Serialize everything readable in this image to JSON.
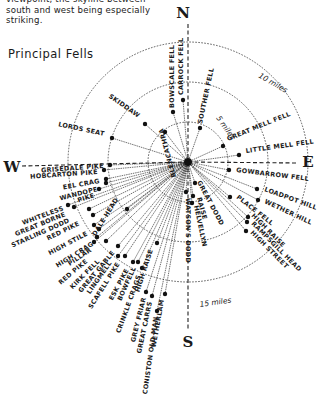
{
  "intro": {
    "lines": [
      "viewpoint, the skyline between",
      "south and west being especially",
      "striking."
    ]
  },
  "section_title": "Principal Fells",
  "diagram": {
    "center": [
      188,
      162
    ],
    "compass": {
      "N": "N",
      "E": "E",
      "S": "S",
      "W": "W"
    },
    "rings": [
      {
        "radius": 40,
        "label": "5 miles"
      },
      {
        "radius": 80,
        "label": "10 miles"
      },
      {
        "radius": 120,
        "label": "15 miles"
      }
    ],
    "fells": [
      {
        "name": "CARROCK FELL",
        "dot": [
          183,
          100
        ],
        "text": [
          183,
          95
        ],
        "rot": -90,
        "anchor": "start"
      },
      {
        "name": "BOWSCALE FELL",
        "dot": [
          173,
          112
        ],
        "text": [
          174,
          108
        ],
        "rot": -90,
        "anchor": "start",
        "flip": true
      },
      {
        "name": "SOUTHER FELL",
        "dot": [
          200,
          128
        ],
        "text": [
          202,
          124
        ],
        "rot": -78,
        "anchor": "start"
      },
      {
        "name": "BLENCATHRA",
        "dot": [
          165,
          132
        ],
        "text": [
          163,
          128
        ],
        "rot": -105,
        "anchor": "end",
        "flip": true
      },
      {
        "name": "SKIDDAW",
        "dot": [
          145,
          124
        ],
        "text": [
          138,
          118
        ],
        "rot": 35,
        "anchor": "end"
      },
      {
        "name": "LORDS SEAT",
        "dot": [
          112,
          138
        ],
        "text": [
          104,
          136
        ],
        "rot": 12,
        "anchor": "end"
      },
      {
        "name": "GREAT MELL FELL",
        "dot": [
          223,
          146
        ],
        "text": [
          228,
          141
        ],
        "rot": -22,
        "anchor": "start"
      },
      {
        "name": "LITTLE MELL FELL",
        "dot": [
          239,
          155
        ],
        "text": [
          246,
          153
        ],
        "rot": -8,
        "anchor": "start"
      },
      {
        "name": "GOWBARROW FELL",
        "dot": [
          229,
          170
        ],
        "text": [
          236,
          172
        ],
        "rot": 7,
        "anchor": "start"
      },
      {
        "name": "LOADPOT HILL",
        "dot": [
          257,
          189
        ],
        "text": [
          264,
          191
        ],
        "rot": 20,
        "anchor": "start"
      },
      {
        "name": "WETHER HILL",
        "dot": [
          258,
          200
        ],
        "text": [
          264,
          203
        ],
        "rot": 25,
        "anchor": "start"
      },
      {
        "name": "PLACE FELL",
        "dot": [
          230,
          197
        ],
        "text": [
          236,
          198
        ],
        "rot": 38,
        "anchor": "start"
      },
      {
        "name": "HIGH RAISE",
        "dot": [
          248,
          217
        ],
        "text": [
          251,
          216
        ],
        "rot": 45,
        "anchor": "start"
      },
      {
        "name": "RAMPSGILL HEAD",
        "dot": [
          247,
          222
        ],
        "text": [
          251,
          224
        ],
        "rot": 45,
        "anchor": "start"
      },
      {
        "name": "HIGH STREET",
        "dot": [
          246,
          231
        ],
        "text": [
          250,
          233
        ],
        "rot": 45,
        "anchor": "start"
      },
      {
        "name": "GREAT DODD",
        "dot": [
          195,
          183
        ],
        "text": [
          197,
          182
        ],
        "rot": 62,
        "anchor": "start"
      },
      {
        "name": "RAISE",
        "dot": [
          193,
          196
        ],
        "text": [
          197,
          198
        ],
        "rot": 75,
        "anchor": "start"
      },
      {
        "name": "HELVELLYN",
        "dot": [
          192,
          203
        ],
        "text": [
          194,
          206
        ],
        "rot": 78,
        "anchor": "start"
      },
      {
        "name": "WATSON'S DODD",
        "dot": [
          186,
          192
        ],
        "text": [
          186,
          198
        ],
        "rot": 90,
        "anchor": "start"
      },
      {
        "name": "GRISEDALE PIKE",
        "dot": [
          110,
          165
        ],
        "text": [
          104,
          168
        ],
        "rot": -4,
        "anchor": "end"
      },
      {
        "name": "HOBCARTON PIKE",
        "dot": [
          104,
          170
        ],
        "text": [
          98,
          174
        ],
        "rot": -4,
        "anchor": "end"
      },
      {
        "name": "EEL CRAG",
        "dot": [
          106,
          179
        ],
        "text": [
          100,
          183
        ],
        "rot": -10,
        "anchor": "end"
      },
      {
        "name": "WANDOPE",
        "dot": [
          106,
          183
        ],
        "text": [
          98,
          191
        ],
        "rot": -14,
        "anchor": "end"
      },
      {
        "name": "PIKE",
        "dot": [
          99,
          189
        ],
        "text": [
          95,
          197
        ],
        "rot": -18,
        "anchor": "end"
      },
      {
        "name": "WHITELESS",
        "dot": [
          68,
          205
        ],
        "text": [
          64,
          210
        ],
        "rot": -20,
        "anchor": "end"
      },
      {
        "name": "GREAT BORNE",
        "dot": [
          74,
          207
        ],
        "text": [
          66,
          216
        ],
        "rot": -22,
        "anchor": "end"
      },
      {
        "name": "STARLING DODD",
        "dot": [
          89,
          209
        ],
        "text": [
          70,
          222
        ],
        "rot": -24,
        "anchor": "end"
      },
      {
        "name": "RED PIKE",
        "dot": [
          93,
          215
        ],
        "text": [
          80,
          225
        ],
        "rot": -26,
        "anchor": "end"
      },
      {
        "name": "HIGH STILE",
        "dot": [
          94,
          225
        ],
        "text": [
          88,
          235
        ],
        "rot": -28,
        "anchor": "end"
      },
      {
        "name": "DALE HEAD",
        "dot": [
          127,
          209
        ],
        "text": [
          107,
          218
        ],
        "rot": -58,
        "anchor": "middle"
      },
      {
        "name": "HIGH CRAG",
        "dot": [
          99,
          229
        ],
        "text": [
          94,
          245
        ],
        "rot": -32,
        "anchor": "end"
      },
      {
        "name": "PILLAR",
        "dot": [
          97,
          237
        ],
        "text": [
          92,
          251
        ],
        "rot": -34,
        "anchor": "end"
      },
      {
        "name": "RED PIKE",
        "dot": [
          94,
          242
        ],
        "text": [
          88,
          262
        ],
        "rot": -40,
        "anchor": "end"
      },
      {
        "name": "KIRK FELL",
        "dot": [
          106,
          241
        ],
        "text": [
          100,
          262
        ],
        "rot": -45,
        "anchor": "end"
      },
      {
        "name": "GREAT GABLE",
        "dot": [
          118,
          246
        ],
        "text": [
          115,
          253
        ],
        "rot": -50,
        "anchor": "end"
      },
      {
        "name": "LINGMELL",
        "dot": [
          118,
          256
        ],
        "text": [
          112,
          263
        ],
        "rot": -55,
        "anchor": "end"
      },
      {
        "name": "SCAFELL PIKE",
        "dot": [
          125,
          256
        ],
        "text": [
          120,
          264
        ],
        "rot": -58,
        "anchor": "end"
      },
      {
        "name": "ESK PIKE",
        "dot": [
          133,
          262
        ],
        "text": [
          129,
          270
        ],
        "rot": -62,
        "anchor": "end"
      },
      {
        "name": "BOWFELL",
        "dot": [
          138,
          262
        ],
        "text": [
          136,
          268
        ],
        "rot": -66,
        "anchor": "end"
      },
      {
        "name": "CRINKLE CRAGS",
        "dot": [
          142,
          268
        ],
        "text": [
          141,
          276
        ],
        "rot": -70,
        "anchor": "end"
      },
      {
        "name": "HIGH RAISE",
        "dot": [
          157,
          243
        ],
        "text": [
          153,
          250
        ],
        "rot": -72,
        "anchor": "end"
      },
      {
        "name": "GREY FRIAR",
        "dot": [
          146,
          292
        ],
        "text": [
          146,
          298
        ],
        "rot": -76,
        "anchor": "end"
      },
      {
        "name": "GREAT CARRS",
        "dot": [
          152,
          296
        ],
        "text": [
          152,
          302
        ],
        "rot": -78,
        "anchor": "end"
      },
      {
        "name": "CONISTON OLD MAN",
        "dot": [
          157,
          311
        ],
        "text": [
          158,
          317
        ],
        "rot": -82,
        "anchor": "end"
      },
      {
        "name": "WETHERLAM",
        "dot": [
          165,
          294
        ],
        "text": [
          164,
          300
        ],
        "rot": -80,
        "anchor": "end"
      }
    ]
  }
}
